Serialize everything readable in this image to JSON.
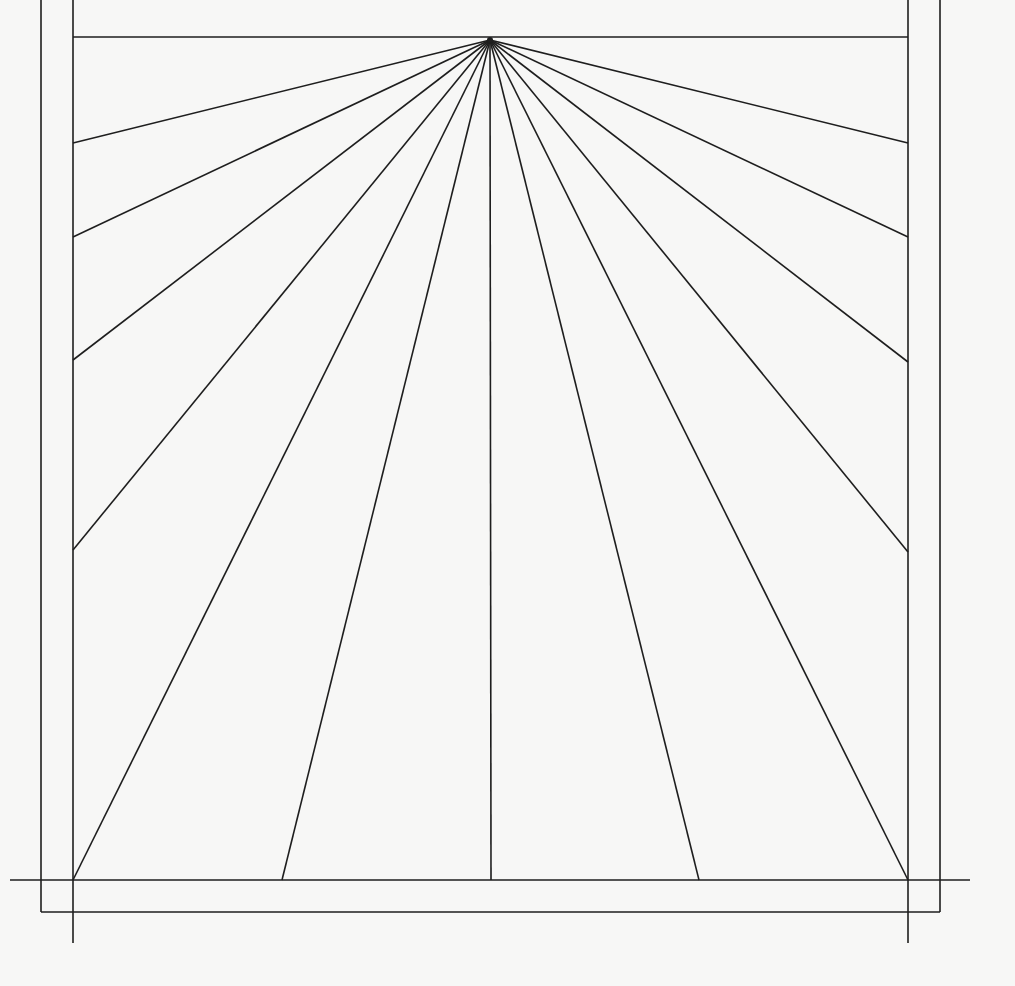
{
  "diagram": {
    "type": "sundial-hour-line-layout",
    "canvas": {
      "width": 1015,
      "height": 986,
      "background": "#f7f7f6"
    },
    "stroke": {
      "color": "#1e1e1e",
      "width": 1.6
    },
    "hub": {
      "x": 490,
      "y": 40
    },
    "frame": {
      "outer": {
        "left": 41,
        "right": 940,
        "bottom": 912,
        "top": 0
      },
      "inner": {
        "left": 73,
        "right": 908,
        "top": 37,
        "bottom": 880
      }
    },
    "extension_lines": {
      "baseline": {
        "x1": 10,
        "x2": 970,
        "y": 880
      },
      "left_tail": {
        "x": 73,
        "y1": 880,
        "y2": 943
      },
      "right_tail": {
        "x": 908,
        "y1": 880,
        "y2": 943
      }
    },
    "rays": [
      {
        "id": "left-1",
        "x": 73,
        "y": 143
      },
      {
        "id": "left-2",
        "x": 73,
        "y": 237
      },
      {
        "id": "left-3",
        "x": 73,
        "y": 360
      },
      {
        "id": "left-4",
        "x": 73,
        "y": 550
      },
      {
        "id": "bottom-left-corner",
        "x": 73,
        "y": 880
      },
      {
        "id": "bottom-1",
        "x": 282,
        "y": 880
      },
      {
        "id": "bottom-center",
        "x": 491,
        "y": 880
      },
      {
        "id": "bottom-2",
        "x": 699,
        "y": 880
      },
      {
        "id": "bottom-right-corner",
        "x": 908,
        "y": 880
      },
      {
        "id": "right-4",
        "x": 908,
        "y": 552
      },
      {
        "id": "right-3",
        "x": 908,
        "y": 362
      },
      {
        "id": "right-2",
        "x": 908,
        "y": 237
      },
      {
        "id": "right-1",
        "x": 908,
        "y": 143
      }
    ]
  }
}
